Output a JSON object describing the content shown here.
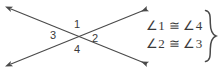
{
  "figure": {
    "type": "intersecting-lines-vertical-angles-diagram",
    "background_color": "#ffffff",
    "stroke_color": "#4a4a4a",
    "text_color": "#3a3a3a"
  },
  "diagram": {
    "intersection": {
      "x": 79,
      "y": 38
    },
    "lines": [
      {
        "name": "line-upper-left-to-lower-right",
        "x1": 11,
        "y1": 9,
        "x2": 147,
        "y2": 64,
        "arrow_start": true,
        "arrow_end": true
      },
      {
        "name": "line-lower-left-to-upper-right",
        "x1": 11,
        "y1": 64,
        "x2": 147,
        "y2": 9,
        "arrow_start": true,
        "arrow_end": true
      }
    ],
    "angle_labels": [
      {
        "id": "1",
        "text": "1",
        "position": "top"
      },
      {
        "id": "2",
        "text": "2",
        "position": "right"
      },
      {
        "id": "3",
        "text": "3",
        "position": "left"
      },
      {
        "id": "4",
        "text": "4",
        "position": "bottom"
      }
    ]
  },
  "annotation": {
    "statements": [
      "∠1 ≅ ∠4",
      "∠2 ≅ ∠3"
    ],
    "brace": "}"
  }
}
